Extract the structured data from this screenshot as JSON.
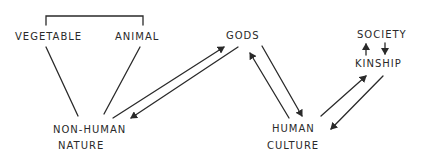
{
  "diagram": {
    "type": "hand-drawn relationship diagram",
    "ink_color": "#2a2a2a",
    "nodes": [
      {
        "id": "vegetable",
        "lines": [
          "VEGETABLE"
        ],
        "x": 15,
        "y": 31
      },
      {
        "id": "animal",
        "lines": [
          "ANIMAL"
        ],
        "x": 115,
        "y": 31
      },
      {
        "id": "gods",
        "lines": [
          "GODS"
        ],
        "x": 226,
        "y": 30
      },
      {
        "id": "society",
        "lines": [
          "SOCIETY"
        ],
        "x": 357,
        "y": 29
      },
      {
        "id": "kinship",
        "lines": [
          "KINSHIP"
        ],
        "x": 355,
        "y": 58
      },
      {
        "id": "non_human_nature",
        "lines": [
          "NON-HUMAN",
          "NATURE"
        ],
        "x": 53,
        "y": 124
      },
      {
        "id": "human_culture",
        "lines": [
          "HUMAN",
          "CULTURE"
        ],
        "x": 269,
        "y": 123
      }
    ],
    "labels": {
      "vegetable": "VEGETABLE",
      "animal": "ANIMAL",
      "gods": "GODS",
      "society": "SOCIETY",
      "kinship": "KINSHIP",
      "non_human_line1": "NON-HUMAN",
      "non_human_line2": "NATURE",
      "human_line1": "HUMAN",
      "human_line2": "CULTURE"
    },
    "edges": [
      {
        "from": "vegetable",
        "to": "animal",
        "style": "bracket"
      },
      {
        "from": "vegetable",
        "to": "non_human_nature",
        "style": "line"
      },
      {
        "from": "animal",
        "to": "non_human_nature",
        "style": "line"
      },
      {
        "from": "non_human_nature",
        "to": "gods",
        "style": "arrow"
      },
      {
        "from": "gods",
        "to": "non_human_nature",
        "style": "arrow"
      },
      {
        "from": "gods",
        "to": "human_culture",
        "style": "arrow"
      },
      {
        "from": "human_culture",
        "to": "gods",
        "style": "arrow"
      },
      {
        "from": "human_culture",
        "to": "kinship",
        "style": "arrow"
      },
      {
        "from": "kinship",
        "to": "human_culture",
        "style": "arrow"
      },
      {
        "from": "kinship",
        "to": "society",
        "style": "arrow"
      },
      {
        "from": "society",
        "to": "kinship",
        "style": "arrow"
      }
    ]
  }
}
